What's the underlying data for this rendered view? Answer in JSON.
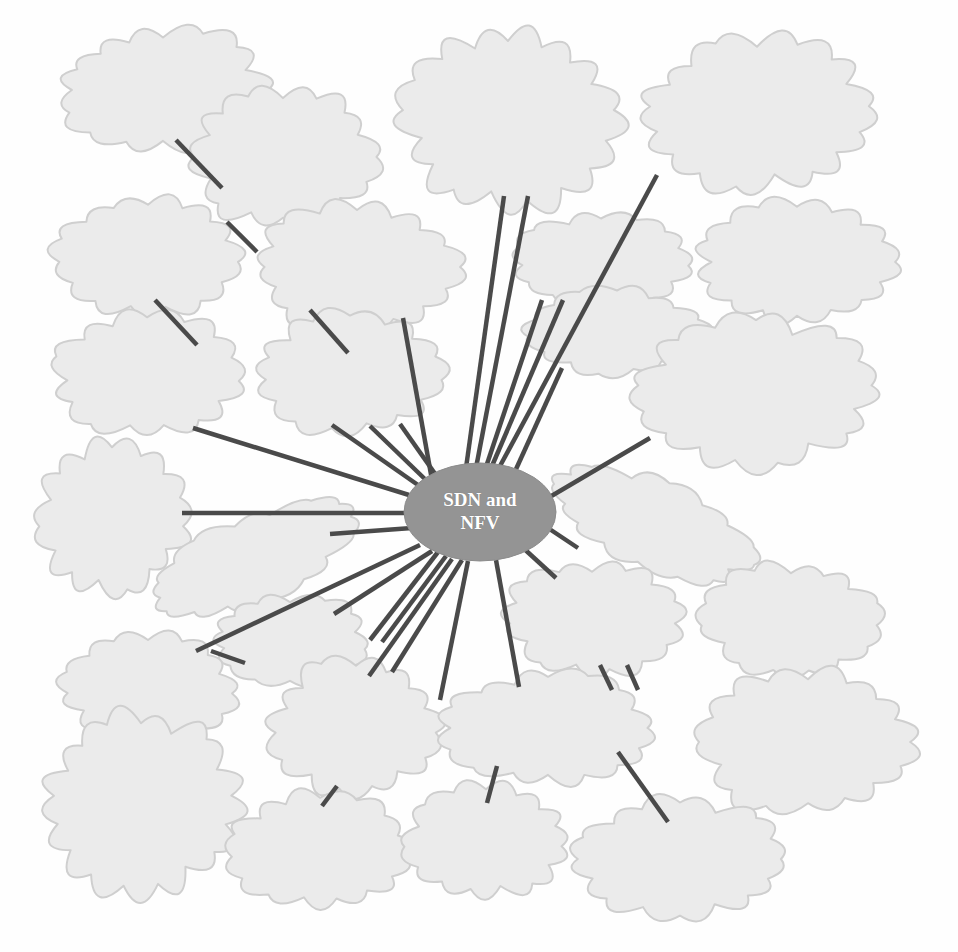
{
  "diagram": {
    "background_color": "#fefefe",
    "cloud_fill": "#ebebeb",
    "cloud_stroke": "#cfcfcf",
    "edge_color": "#4a4a4a",
    "hub_fill": "#949494",
    "hub_text_color": "#ffffff",
    "text_color": "#141414"
  },
  "hub": {
    "label": "SDN and\nNFV",
    "cx": 480,
    "cy": 512,
    "rx": 76,
    "ry": 49,
    "font_size": 19
  },
  "nodes": [
    {
      "id": "network-management",
      "label": "Network\nmanagement",
      "cx": 163,
      "cy": 90,
      "rx": 96,
      "ry": 56,
      "font_size": 20,
      "rotate": 0,
      "connected_to_hub": false
    },
    {
      "id": "multi-technology",
      "label": "Multi-\ntechnology\ncoexistence",
      "cx": 283,
      "cy": 157,
      "rx": 86,
      "ry": 62,
      "font_size": 20,
      "rotate": 0,
      "connected_to_hub": false
    },
    {
      "id": "service-provisioning",
      "label": "Service\nprovisioning\nand\noptimization",
      "cx": 508,
      "cy": 118,
      "rx": 98,
      "ry": 80,
      "font_size": 20,
      "rotate": 0,
      "connected_to_hub": true
    },
    {
      "id": "heterogeneous-networks",
      "label": "Heterogeneous\nnetworks\nmanagement",
      "cx": 757,
      "cy": 113,
      "rx": 104,
      "ry": 68,
      "font_size": 20,
      "rotate": 0,
      "connected_to_hub": true
    },
    {
      "id": "security-control",
      "label": "Security\ncontrol",
      "cx": 148,
      "cy": 256,
      "rx": 84,
      "ry": 52,
      "font_size": 20,
      "rotate": 0,
      "connected_to_hub": false
    },
    {
      "id": "virtualization",
      "label": "Virtualization\nenvironment",
      "cx": 357,
      "cy": 267,
      "rx": 96,
      "ry": 57,
      "font_size": 20,
      "rotate": 0,
      "connected_to_hub": true
    },
    {
      "id": "flexibility",
      "label": "Flexibility",
      "cx": 601,
      "cy": 261,
      "rx": 82,
      "ry": 42,
      "font_size": 20,
      "rotate": 0,
      "connected_to_hub": true
    },
    {
      "id": "artificial-intelligence",
      "label": "Artificial\nintelligence",
      "cx": 797,
      "cy": 262,
      "rx": 92,
      "ry": 54,
      "font_size": 20,
      "rotate": 0,
      "connected_to_hub": false
    },
    {
      "id": "robustness",
      "label": "Robustness",
      "cx": 617,
      "cy": 332,
      "rx": 84,
      "ry": 40,
      "font_size": 20,
      "rotate": 0,
      "connected_to_hub": true
    },
    {
      "id": "spectrum-utilization",
      "label": "Spectrum\nutilization",
      "cx": 147,
      "cy": 375,
      "rx": 87,
      "ry": 55,
      "font_size": 20,
      "rotate": 0,
      "connected_to_hub": true
    },
    {
      "id": "resource-allocation",
      "label": "Resource\nallocation",
      "cx": 350,
      "cy": 374,
      "rx": 87,
      "ry": 55,
      "font_size": 20,
      "rotate": 0,
      "connected_to_hub": true
    },
    {
      "id": "power-management",
      "label": "Power\nmanagement and\noptimization",
      "cx": 756,
      "cy": 392,
      "rx": 110,
      "ry": 67,
      "font_size": 20,
      "rotate": 0,
      "connected_to_hub": true
    },
    {
      "id": "qos-and-qoe",
      "label": "QoS\nand\nQoE",
      "cx": 112,
      "cy": 519,
      "rx": 68,
      "ry": 66,
      "font_size": 20,
      "rotate": 0,
      "connected_to_hub": true
    },
    {
      "id": "adaptability",
      "label": "Adaptability",
      "cx": 653,
      "cy": 524,
      "rx": 104,
      "ry": 40,
      "font_size": 20,
      "rotate": 22,
      "connected_to_hub": true
    },
    {
      "id": "scalability",
      "label": "Scalability",
      "cx": 249,
      "cy": 560,
      "rx": 106,
      "ry": 40,
      "font_size": 20,
      "rotate": -23,
      "connected_to_hub": true
    },
    {
      "id": "access-control",
      "label": "Access\ncontrol",
      "cx": 592,
      "cy": 618,
      "rx": 80,
      "ry": 50,
      "font_size": 20,
      "rotate": 0,
      "connected_to_hub": true
    },
    {
      "id": "response-speed",
      "label": "Response\nspeed",
      "cx": 791,
      "cy": 620,
      "rx": 83,
      "ry": 50,
      "font_size": 20,
      "rotate": 0,
      "connected_to_hub": false
    },
    {
      "id": "aaa",
      "label": "AAA",
      "cx": 290,
      "cy": 640,
      "rx": 74,
      "ry": 40,
      "font_size": 20,
      "rotate": 0,
      "connected_to_hub": true
    },
    {
      "id": "low-latency",
      "label": "Low\nlatency",
      "cx": 148,
      "cy": 688,
      "rx": 82,
      "ry": 50,
      "font_size": 20,
      "rotate": 0,
      "connected_to_hub": true
    },
    {
      "id": "low-network-cost",
      "label": "Low\nnetwork\ncost",
      "cx": 356,
      "cy": 726,
      "rx": 78,
      "ry": 62,
      "font_size": 20,
      "rotate": 0,
      "connected_to_hub": true
    },
    {
      "id": "network-monitoring",
      "label": "Network\nmonitoring",
      "cx": 548,
      "cy": 728,
      "rx": 97,
      "ry": 52,
      "font_size": 20,
      "rotate": 0,
      "connected_to_hub": true
    },
    {
      "id": "availability-redundancy",
      "label": "Availability\nand\nredundancy",
      "cx": 808,
      "cy": 742,
      "rx": 100,
      "ry": 63,
      "font_size": 20,
      "rotate": 0,
      "connected_to_hub": false
    },
    {
      "id": "failure-detection",
      "label": "Failure\ndetection\nand\ncorrection",
      "cx": 141,
      "cy": 803,
      "rx": 89,
      "ry": 79,
      "font_size": 20,
      "rotate": 0,
      "connected_to_hub": false
    },
    {
      "id": "proximity-service",
      "label": "Proximity\nservice",
      "cx": 320,
      "cy": 851,
      "rx": 85,
      "ry": 52,
      "font_size": 20,
      "rotate": 0,
      "connected_to_hub": false
    },
    {
      "id": "privacy-control",
      "label": "Privacy\ncontrol",
      "cx": 486,
      "cy": 841,
      "rx": 75,
      "ry": 50,
      "font_size": 20,
      "rotate": 0,
      "connected_to_hub": false
    },
    {
      "id": "mobility-management",
      "label": "Mobility\nmanagement",
      "cx": 680,
      "cy": 859,
      "rx": 100,
      "ry": 54,
      "font_size": 20,
      "rotate": 0,
      "connected_to_hub": false
    }
  ],
  "edges": [
    {
      "id": "edge-network-management-multi-technology",
      "from": "network-management",
      "to": "multi-technology",
      "x1": 176,
      "y1": 140,
      "x2": 222,
      "y2": 188
    },
    {
      "id": "edge-security-control-multi-technology",
      "from": "security-control",
      "to": "multi-technology",
      "x1": 227,
      "y1": 222,
      "x2": 257,
      "y2": 252
    },
    {
      "id": "edge-security-control-spectrum",
      "from": "security-control",
      "to": "spectrum-utilization",
      "x1": 155,
      "y1": 300,
      "x2": 197,
      "y2": 345
    },
    {
      "id": "edge-virtualization-resource",
      "from": "virtualization",
      "to": "resource-allocation",
      "x1": 310,
      "y1": 310,
      "x2": 348,
      "y2": 353
    },
    {
      "id": "edge-virtualization-hub",
      "from": "virtualization",
      "to": "hub",
      "x1": 403,
      "y1": 318,
      "x2": 432,
      "y2": 480
    },
    {
      "id": "edge-service-hub-a",
      "from": "service-provisioning",
      "to": "hub",
      "x1": 504,
      "y1": 196,
      "x2": 466,
      "y2": 468
    },
    {
      "id": "edge-service-hub-b",
      "from": "service-provisioning",
      "to": "hub",
      "x1": 528,
      "y1": 196,
      "x2": 476,
      "y2": 468
    },
    {
      "id": "edge-heterogeneous-hub",
      "from": "heterogeneous-networks",
      "to": "hub",
      "x1": 657,
      "y1": 175,
      "x2": 500,
      "y2": 466
    },
    {
      "id": "edge-flexibility-hub",
      "from": "flexibility",
      "to": "hub",
      "x1": 563,
      "y1": 300,
      "x2": 492,
      "y2": 466
    },
    {
      "id": "edge-robustness-hub",
      "from": "robustness",
      "to": "hub",
      "x1": 562,
      "y1": 368,
      "x2": 512,
      "y2": 478
    },
    {
      "id": "edge-power-hub",
      "from": "power-management",
      "to": "hub",
      "x1": 650,
      "y1": 438,
      "x2": 548,
      "y2": 498
    },
    {
      "id": "edge-adaptability-hub",
      "from": "adaptability",
      "to": "hub",
      "x1": 578,
      "y1": 548,
      "x2": 548,
      "y2": 528
    },
    {
      "id": "edge-access-hub",
      "from": "access-control",
      "to": "hub",
      "x1": 556,
      "y1": 578,
      "x2": 521,
      "y2": 546
    },
    {
      "id": "edge-access-network-monitoring",
      "from": "access-control",
      "to": "network-monitoring",
      "x1": 600,
      "y1": 665,
      "x2": 612,
      "y2": 690
    },
    {
      "id": "edge-access-network-monitoring-2",
      "from": "access-control",
      "to": "network-monitoring",
      "x1": 627,
      "y1": 665,
      "x2": 638,
      "y2": 690
    },
    {
      "id": "edge-network-monitoring-hub",
      "from": "network-monitoring",
      "to": "hub",
      "x1": 519,
      "y1": 687,
      "x2": 496,
      "y2": 560
    },
    {
      "id": "edge-network-monitoring-privacy",
      "from": "network-monitoring",
      "to": "privacy-control",
      "x1": 497,
      "y1": 766,
      "x2": 487,
      "y2": 803
    },
    {
      "id": "edge-network-monitoring-mobility",
      "from": "network-monitoring",
      "to": "mobility-management",
      "x1": 618,
      "y1": 752,
      "x2": 668,
      "y2": 822
    },
    {
      "id": "edge-low-network-cost-hub-a",
      "from": "low-network-cost",
      "to": "hub",
      "x1": 369,
      "y1": 676,
      "x2": 452,
      "y2": 559
    },
    {
      "id": "edge-low-network-cost-hub-b",
      "from": "low-network-cost",
      "to": "hub",
      "x1": 392,
      "y1": 672,
      "x2": 462,
      "y2": 560
    },
    {
      "id": "edge-low-network-cost-proximity",
      "from": "low-network-cost",
      "to": "proximity-service",
      "x1": 337,
      "y1": 786,
      "x2": 322,
      "y2": 806
    },
    {
      "id": "edge-aaa-hub",
      "from": "aaa",
      "to": "hub",
      "x1": 334,
      "y1": 614,
      "x2": 432,
      "y2": 551
    },
    {
      "id": "edge-aaa-low-latency",
      "from": "aaa",
      "to": "low-latency",
      "x1": 245,
      "y1": 663,
      "x2": 211,
      "y2": 651
    },
    {
      "id": "edge-low-latency-hub",
      "from": "low-latency",
      "to": "hub",
      "x1": 196,
      "y1": 651,
      "x2": 420,
      "y2": 545
    },
    {
      "id": "edge-scalability-hub",
      "from": "scalability",
      "to": "hub",
      "x1": 330,
      "y1": 534,
      "x2": 412,
      "y2": 528
    },
    {
      "id": "edge-qos-hub",
      "from": "qos-and-qoe",
      "to": "hub",
      "x1": 182,
      "y1": 513,
      "x2": 404,
      "y2": 513
    },
    {
      "id": "edge-spectrum-hub",
      "from": "spectrum-utilization",
      "to": "hub",
      "x1": 193,
      "y1": 428,
      "x2": 409,
      "y2": 495
    },
    {
      "id": "edge-resource-hub-a",
      "from": "resource-allocation",
      "to": "hub",
      "x1": 332,
      "y1": 425,
      "x2": 418,
      "y2": 485
    },
    {
      "id": "edge-resource-hub-b",
      "from": "resource-allocation",
      "to": "hub",
      "x1": 370,
      "y1": 426,
      "x2": 428,
      "y2": 482
    },
    {
      "id": "edge-resource-hub-c",
      "from": "resource-allocation",
      "to": "hub",
      "x1": 400,
      "y1": 424,
      "x2": 438,
      "y2": 478
    },
    {
      "id": "edge-hub-down-left-1",
      "from": "hub",
      "to": "aaa",
      "x1": 438,
      "y1": 552,
      "x2": 370,
      "y2": 640
    },
    {
      "id": "edge-hub-down-left-2",
      "from": "hub",
      "to": "aaa",
      "x1": 446,
      "y1": 556,
      "x2": 382,
      "y2": 642
    },
    {
      "id": "edge-hub-down-center",
      "from": "hub",
      "to": "low-network-cost",
      "x1": 468,
      "y1": 561,
      "x2": 440,
      "y2": 700
    },
    {
      "id": "edge-hub-up-center",
      "from": "hub",
      "to": "flexibility",
      "x1": 487,
      "y1": 464,
      "x2": 542,
      "y2": 300
    }
  ]
}
